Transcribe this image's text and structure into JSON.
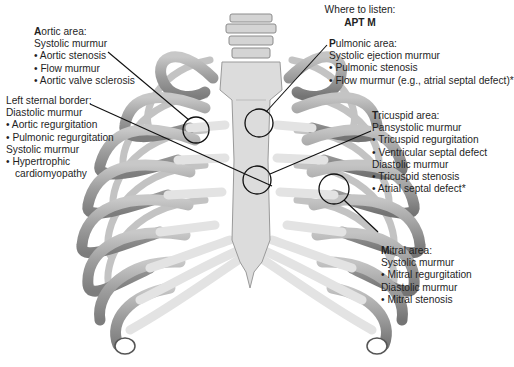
{
  "header": {
    "title": "Where to listen:",
    "mnemonic": "APT M"
  },
  "areas": {
    "aortic": {
      "initial": "A",
      "rest": "ortic area:",
      "lines": [
        "Systolic murmur",
        "• Aortic stenosis",
        "• Flow murmur",
        "• Aortic valve sclerosis"
      ]
    },
    "left_sternal_border": {
      "title": "Left sternal border:",
      "lines": [
        "Diastolic murmur",
        "• Aortic regurgitation",
        "• Pulmonic regurgitation",
        "Systolic murmur",
        "• Hypertrophic",
        "  cardiomyopathy"
      ]
    },
    "pulmonic": {
      "initial": "P",
      "rest": "ulmonic area:",
      "lines": [
        "Systolic ejection murmur",
        "• Pulmonic stenosis",
        "• Flow murmur (e.g., atrial septal defect)*"
      ]
    },
    "tricuspid": {
      "initial": "T",
      "rest": "ricuspid area:",
      "lines": [
        "Pansystolic murmur",
        "• Tricuspid regurgitation",
        "• Ventricular septal defect",
        "Diastolic murmur",
        "• Tricuspid stenosis",
        "• Atrial septal defect*"
      ]
    },
    "mitral": {
      "initial": "M",
      "rest": "itral area:",
      "lines": [
        "Systolic murmur",
        "• Mitral regurgitation",
        "Diastolic murmur",
        "• Mitral stenosis"
      ]
    }
  },
  "colors": {
    "bone_light": "#d9d9d9",
    "bone_mid": "#a9a9a9",
    "bone_dark": "#7a7a7a",
    "cartilage": "#e6e6e6",
    "outline": "#5a5a5a",
    "leader": "#111111"
  }
}
